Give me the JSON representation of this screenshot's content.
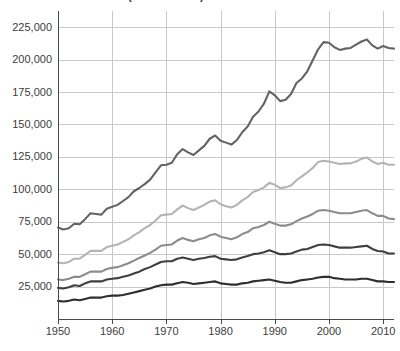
{
  "title": "HOUSEHOLD INCOME (IN DOLLARS)",
  "axis": {
    "y_ticks": [
      "25,000",
      "50,000",
      "75,000",
      "100,000",
      "125,000",
      "150,000",
      "175,000",
      "200,000",
      "225,000"
    ],
    "x_ticks": [
      "1950",
      "1960",
      "1970",
      "1980",
      "1990",
      "2000",
      "2010"
    ],
    "ylabel": "",
    "xlabel": ""
  },
  "colors": {
    "top5": "#636363",
    "fourth": "#b4b4b4",
    "third": "#8c8c8c",
    "second": "#3f3f3f",
    "lowest": "#2e2e2e",
    "gridline": "#c9c9c9",
    "axis": "#4a4a4a",
    "text": "#3c3c3c",
    "background": "#ffffff"
  },
  "chart_data": {
    "type": "line",
    "title": "HOUSEHOLD INCOME (IN DOLLARS)",
    "xlabel": "",
    "ylabel": "",
    "xlim": [
      1950,
      2012
    ],
    "ylim": [
      0,
      237500
    ],
    "grid": true,
    "legend": "none",
    "xtick_values": [
      1950,
      1960,
      1970,
      1980,
      1990,
      2000,
      2010
    ],
    "ytick_values": [
      25000,
      50000,
      75000,
      100000,
      125000,
      150000,
      175000,
      200000,
      225000
    ],
    "x": [
      1950,
      1951,
      1952,
      1953,
      1954,
      1955,
      1956,
      1957,
      1958,
      1959,
      1960,
      1961,
      1962,
      1963,
      1964,
      1965,
      1966,
      1967,
      1968,
      1969,
      1970,
      1971,
      1972,
      1973,
      1974,
      1975,
      1976,
      1977,
      1978,
      1979,
      1980,
      1981,
      1982,
      1983,
      1984,
      1985,
      1986,
      1987,
      1988,
      1989,
      1990,
      1991,
      1992,
      1993,
      1994,
      1995,
      1996,
      1997,
      1998,
      1999,
      2000,
      2001,
      2002,
      2003,
      2004,
      2005,
      2006,
      2007,
      2008,
      2009,
      2010,
      2011,
      2012
    ],
    "series": [
      {
        "name": "Top 5 percent lower limit",
        "color": "#636363",
        "values": [
          70500,
          69000,
          70000,
          73500,
          73000,
          77000,
          81500,
          81000,
          80500,
          85000,
          86500,
          88000,
          91000,
          94000,
          98500,
          101000,
          104000,
          107500,
          113000,
          118500,
          119000,
          120500,
          127000,
          131000,
          128500,
          126500,
          130000,
          133500,
          139000,
          141500,
          137500,
          136000,
          134500,
          138000,
          144000,
          148500,
          156000,
          160000,
          166000,
          175500,
          172500,
          168000,
          169000,
          173500,
          182000,
          185500,
          191000,
          199500,
          208000,
          213500,
          213000,
          209500,
          207500,
          208500,
          209000,
          211500,
          214000,
          215500,
          211000,
          208500,
          210500,
          209000,
          208500
        ]
      },
      {
        "name": "Fourth quintile upper limit",
        "color": "#b4b4b4",
        "values": [
          43500,
          43000,
          44000,
          46500,
          46500,
          49500,
          52500,
          52500,
          52500,
          55500,
          56500,
          57500,
          59500,
          61500,
          64500,
          67000,
          70000,
          72500,
          76000,
          80000,
          80500,
          81000,
          84500,
          87500,
          85500,
          84000,
          86000,
          88000,
          90500,
          91500,
          88500,
          87000,
          86000,
          88000,
          91500,
          94000,
          98000,
          99500,
          101500,
          105000,
          103500,
          101000,
          101500,
          103000,
          107000,
          110000,
          113000,
          116500,
          121000,
          122000,
          121500,
          120500,
          119500,
          120000,
          120000,
          121500,
          123500,
          124500,
          121500,
          119500,
          120500,
          119000,
          119000
        ]
      },
      {
        "name": "Third quintile upper limit",
        "color": "#8c8c8c",
        "values": [
          30500,
          30000,
          31000,
          32500,
          32500,
          34500,
          36500,
          36500,
          36500,
          38500,
          39500,
          40000,
          41500,
          43000,
          45000,
          47000,
          49000,
          51000,
          53500,
          56500,
          57000,
          57500,
          60500,
          62500,
          61000,
          60000,
          61500,
          62500,
          64500,
          65500,
          63500,
          62500,
          61500,
          63000,
          65500,
          67000,
          70000,
          71000,
          72500,
          75000,
          73500,
          72000,
          72000,
          73000,
          75500,
          77500,
          79000,
          81000,
          83500,
          84000,
          83500,
          82500,
          81500,
          81500,
          81500,
          82500,
          83500,
          84000,
          81500,
          79500,
          79500,
          77500,
          77000
        ]
      },
      {
        "name": "Second quintile upper limit",
        "color": "#3f3f3f",
        "values": [
          24000,
          23500,
          24500,
          26000,
          25500,
          27500,
          29000,
          29000,
          29000,
          30500,
          31000,
          31500,
          32500,
          33500,
          35000,
          36500,
          38500,
          40000,
          42000,
          44000,
          44500,
          44500,
          46500,
          47500,
          46500,
          45500,
          46500,
          47000,
          48000,
          48500,
          46500,
          46000,
          45500,
          46000,
          47500,
          48500,
          50000,
          50500,
          51500,
          53000,
          51500,
          50000,
          50000,
          50500,
          52000,
          53500,
          54000,
          55500,
          57000,
          57500,
          57000,
          56000,
          55000,
          55000,
          55000,
          55500,
          56000,
          56500,
          54000,
          52500,
          52000,
          50500,
          50500
        ]
      },
      {
        "name": "Lowest quintile upper limit",
        "color": "#2e2e2e",
        "values": [
          14000,
          13500,
          14000,
          15000,
          14500,
          15500,
          16500,
          16500,
          16500,
          17500,
          18000,
          18000,
          18500,
          19500,
          20500,
          21500,
          22500,
          23500,
          25000,
          26000,
          26500,
          26500,
          27500,
          28500,
          28000,
          27000,
          27500,
          28000,
          28500,
          29000,
          27500,
          27000,
          26500,
          26500,
          27500,
          28000,
          29000,
          29500,
          30000,
          30500,
          29500,
          28500,
          28000,
          28000,
          29000,
          30000,
          30500,
          31000,
          32000,
          32500,
          32500,
          31500,
          31000,
          30500,
          30500,
          30500,
          31000,
          31000,
          30000,
          29000,
          29000,
          28500,
          28500
        ]
      }
    ]
  }
}
